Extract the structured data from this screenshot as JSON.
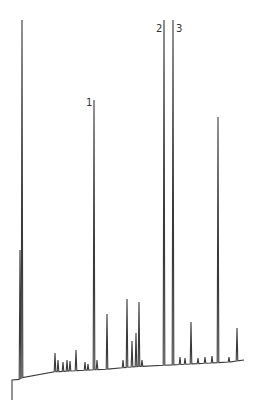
{
  "chart_data": {
    "type": "line",
    "subtype": "chromatogram",
    "title": "",
    "xlabel": "",
    "ylabel": "",
    "grid": false,
    "legend": null,
    "line_color": "#3a3a3a",
    "baseline": {
      "start_x": 12,
      "start_y": 380,
      "dip_y": 400,
      "points": [
        [
          12,
          380
        ],
        [
          18,
          380
        ],
        [
          22,
          378
        ],
        [
          30,
          374
        ],
        [
          40,
          373
        ],
        [
          52,
          372
        ],
        [
          70,
          371
        ],
        [
          90,
          370
        ],
        [
          110,
          369
        ],
        [
          130,
          367
        ],
        [
          150,
          366
        ],
        [
          170,
          365
        ],
        [
          190,
          364
        ],
        [
          210,
          363
        ],
        [
          230,
          362
        ],
        [
          244,
          360
        ]
      ]
    },
    "peaks": [
      {
        "x": 22,
        "top": 20,
        "label": ""
      },
      {
        "x": 20,
        "top": 250,
        "label": ""
      },
      {
        "x": 55,
        "top": 353,
        "label": ""
      },
      {
        "x": 58,
        "top": 360,
        "label": ""
      },
      {
        "x": 63,
        "top": 362,
        "label": ""
      },
      {
        "x": 67,
        "top": 360,
        "label": ""
      },
      {
        "x": 70,
        "top": 361,
        "label": ""
      },
      {
        "x": 76,
        "top": 350,
        "label": ""
      },
      {
        "x": 85,
        "top": 362,
        "label": ""
      },
      {
        "x": 88,
        "top": 364,
        "label": ""
      },
      {
        "x": 94,
        "top": 100,
        "label": "1"
      },
      {
        "x": 97,
        "top": 360,
        "label": ""
      },
      {
        "x": 107,
        "top": 314,
        "label": ""
      },
      {
        "x": 123,
        "top": 360,
        "label": ""
      },
      {
        "x": 127,
        "top": 299,
        "label": ""
      },
      {
        "x": 132,
        "top": 341,
        "label": ""
      },
      {
        "x": 136,
        "top": 333,
        "label": ""
      },
      {
        "x": 139,
        "top": 302,
        "label": ""
      },
      {
        "x": 142,
        "top": 360,
        "label": ""
      },
      {
        "x": 164,
        "top": 20,
        "label": "2"
      },
      {
        "x": 173,
        "top": 20,
        "label": "3"
      },
      {
        "x": 180,
        "top": 357,
        "label": ""
      },
      {
        "x": 185,
        "top": 358,
        "label": ""
      },
      {
        "x": 191,
        "top": 322,
        "label": ""
      },
      {
        "x": 198,
        "top": 358,
        "label": ""
      },
      {
        "x": 205,
        "top": 357,
        "label": ""
      },
      {
        "x": 212,
        "top": 356,
        "label": ""
      },
      {
        "x": 218,
        "top": 117,
        "label": ""
      },
      {
        "x": 229,
        "top": 357,
        "label": ""
      },
      {
        "x": 237,
        "top": 328,
        "label": ""
      }
    ],
    "annotations": [
      {
        "text": "1",
        "x": 86,
        "y": 98
      },
      {
        "text": "2",
        "x": 156,
        "y": 24
      },
      {
        "text": "3",
        "x": 176,
        "y": 24
      }
    ]
  }
}
